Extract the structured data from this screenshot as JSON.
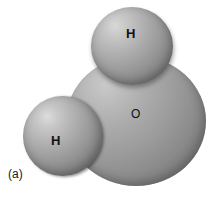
{
  "figure": {
    "caption": "(a)",
    "background_color": "#ffffff",
    "atoms": [
      {
        "id": "h-top",
        "label": "H",
        "element": "hydrogen",
        "role": "upper hydrogen sphere",
        "fill_color": "#9d9d9d",
        "highlight_color": "#d8d8d8"
      },
      {
        "id": "h-left",
        "label": "H",
        "element": "hydrogen",
        "role": "lower-left hydrogen sphere",
        "fill_color": "#9d9d9d",
        "highlight_color": "#dcdcdc"
      },
      {
        "id": "o",
        "label": "O",
        "element": "oxygen",
        "role": "large central oxygen sphere",
        "fill_color": "#9b9b9b",
        "highlight_color": "#c9c9c9"
      }
    ]
  }
}
